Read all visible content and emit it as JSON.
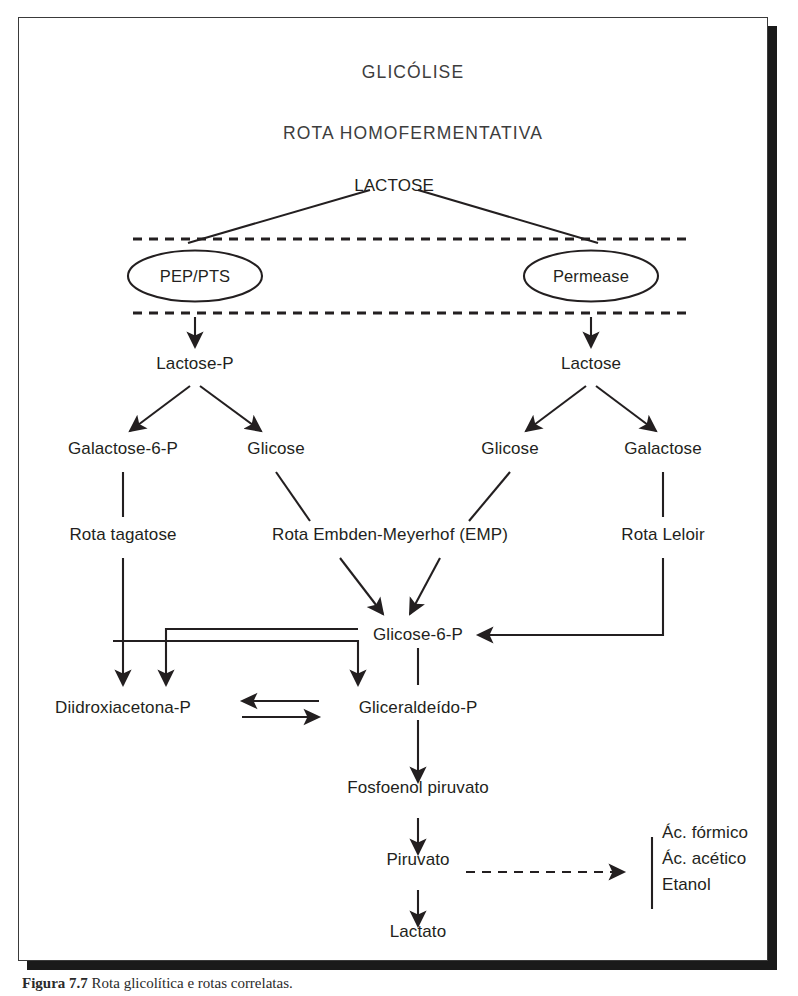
{
  "figure": {
    "title_main": "GLICÓLISE",
    "title_sub": "ROTA HOMOFERMENTATIVA",
    "caption_label": "Figura 7.7",
    "caption_text": "Rota glicolítica e rotas correlatas.",
    "frame_color": "#3a3a3a",
    "ink_color": "#231f20",
    "background": "#ffffff"
  },
  "nodes": {
    "lactose_top": "LACTOSE",
    "transporter_left": "PEP/PTS",
    "transporter_right": "Permease",
    "lactose_p": "Lactose-P",
    "lactose_in": "Lactose",
    "galactose_6_p": "Galactose-6-P",
    "glicose_left": "Glicose",
    "glicose_right": "Glicose",
    "galactose": "Galactose",
    "rota_tagatose": "Rota tagatose",
    "rota_emp": "Rota Embden-Meyerhof (EMP)",
    "rota_leloir": "Rota Leloir",
    "glicose_6_p": "Glicose-6-P",
    "diidroxiacetona_p": "Diidroxiacetona-P",
    "gliceraldeido_p": "Gliceraldeído-P",
    "fosfoenol_piruvato": "Fosfoenol piruvato",
    "piruvato": "Piruvato",
    "lactato": "Lactato",
    "product_1": "Ác. fórmico",
    "product_2": "Ác. acético",
    "product_3": "Etanol"
  }
}
